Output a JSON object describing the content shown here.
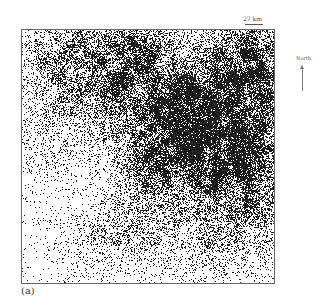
{
  "figure": {
    "panel_label": "(a)",
    "scale": {
      "label": "27 km"
    },
    "north": {
      "label": "North"
    },
    "map": {
      "description": "Binary classification map (black = class pixels, white = background)",
      "colors": {
        "foreground": "#111111",
        "background": "#ffffff",
        "frame": "#666666"
      },
      "hotspots": [
        {
          "x": 0.82,
          "y": 0.42,
          "r": 0.16,
          "d": 0.75
        },
        {
          "x": 0.62,
          "y": 0.32,
          "r": 0.14,
          "d": 0.55
        },
        {
          "x": 0.92,
          "y": 0.12,
          "r": 0.12,
          "d": 0.6
        },
        {
          "x": 0.35,
          "y": 0.22,
          "r": 0.14,
          "d": 0.35
        },
        {
          "x": 0.18,
          "y": 0.12,
          "r": 0.12,
          "d": 0.3
        },
        {
          "x": 0.45,
          "y": 0.08,
          "r": 0.1,
          "d": 0.35
        },
        {
          "x": 0.55,
          "y": 0.55,
          "r": 0.1,
          "d": 0.4
        },
        {
          "x": 0.88,
          "y": 0.7,
          "r": 0.12,
          "d": 0.35
        },
        {
          "x": 0.45,
          "y": 0.78,
          "r": 0.08,
          "d": 0.2
        },
        {
          "x": 0.3,
          "y": 0.82,
          "r": 0.1,
          "d": 0.15
        },
        {
          "x": 0.7,
          "y": 0.88,
          "r": 0.12,
          "d": 0.15
        },
        {
          "x": 0.08,
          "y": 0.45,
          "r": 0.1,
          "d": 0.12
        }
      ],
      "background_density": 0.035,
      "seed": 12345
    }
  }
}
